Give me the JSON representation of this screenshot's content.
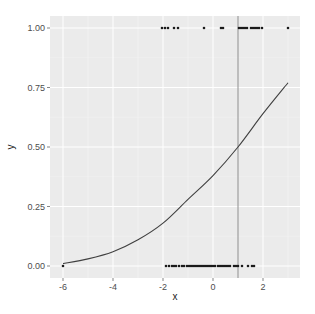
{
  "chart_data": {
    "type": "scatter",
    "title": "",
    "xlabel": "x",
    "ylabel": "y",
    "xlim": [
      -6.5,
      3.5
    ],
    "ylim": [
      -0.05,
      1.05
    ],
    "x_ticks": [
      -6,
      -4,
      -2,
      0,
      2
    ],
    "x_tick_labels": [
      "-6",
      "-4",
      "-2",
      "0",
      "2"
    ],
    "y_ticks": [
      0,
      0.25,
      0.5,
      0.75,
      1
    ],
    "y_tick_labels": [
      "0.00",
      "0.25",
      "0.50",
      "0.75",
      "1.00"
    ],
    "grid": true,
    "legend": "none",
    "series": [
      {
        "name": "y = 1 observations",
        "type": "scatter",
        "y": 1,
        "x": [
          -2.04,
          -1.92,
          -1.8,
          -1.56,
          -1.4,
          -0.36,
          0.32,
          0.4,
          1.04,
          1.12,
          1.2,
          1.28,
          1.36,
          1.52,
          1.6,
          1.68,
          1.76,
          1.84,
          1.96,
          3.0
        ]
      },
      {
        "name": "y = 0 observations",
        "type": "scatter",
        "y": 0,
        "x": [
          -6.0,
          -1.88,
          -1.76,
          -1.64,
          -1.56,
          -1.48,
          -1.36,
          -1.24,
          -1.16,
          -1.04,
          -0.96,
          -0.88,
          -0.8,
          -0.72,
          -0.64,
          -0.56,
          -0.48,
          -0.4,
          -0.32,
          -0.24,
          -0.16,
          -0.08,
          0.0,
          0.08,
          0.2,
          0.28,
          0.36,
          0.44,
          0.52,
          0.6,
          0.68,
          0.84,
          0.92,
          1.0,
          1.16,
          1.4,
          1.56,
          1.64
        ]
      },
      {
        "name": "fitted logistic curve",
        "type": "line",
        "x": [
          -6,
          -5,
          -4,
          -3,
          -2,
          -1,
          0,
          1,
          2,
          3
        ],
        "y": [
          0.01,
          0.03,
          0.06,
          0.11,
          0.18,
          0.28,
          0.38,
          0.5,
          0.64,
          0.77
        ]
      }
    ],
    "annotations": [
      {
        "type": "vline",
        "x": 1,
        "color": "#8c8c8c"
      }
    ]
  },
  "colors": {
    "panel_bg": "#ebebeb",
    "grid_major": "#ffffff",
    "points": "#1a1a1a",
    "curve": "#404040",
    "vline": "#8c8c8c"
  }
}
